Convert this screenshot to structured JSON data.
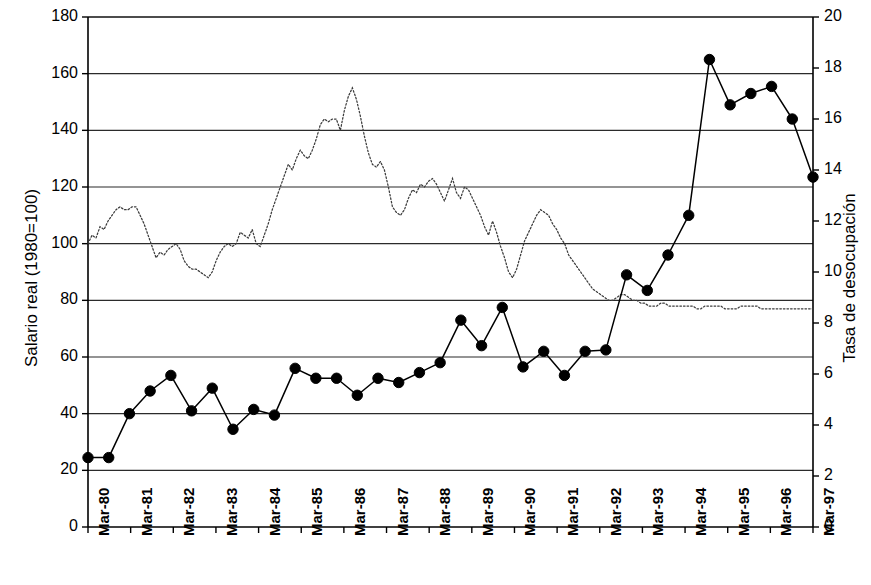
{
  "chart": {
    "title": "",
    "left_axis_title": "Salario real (1980=100)",
    "right_axis_title": "Tasa de desocupación",
    "left_ticks": [
      "0",
      "20",
      "40",
      "60",
      "80",
      "100",
      "120",
      "140",
      "160",
      "180"
    ],
    "right_ticks": [
      "0",
      "2",
      "4",
      "6",
      "8",
      "10",
      "12",
      "14",
      "16",
      "18",
      "20"
    ],
    "x_ticks": [
      "Mar-80",
      "Mar-81",
      "Mar-82",
      "Mar-83",
      "Mar-84",
      "Mar-85",
      "Mar-86",
      "Mar-87",
      "Mar-88",
      "Mar-89",
      "Mar-90",
      "Mar-91",
      "Mar-92",
      "Mar-93",
      "Mar-94",
      "Mar-95",
      "Mar-96",
      "Mar-97"
    ],
    "colors": {
      "axis": "#000000",
      "series_marker": "#000000",
      "series_dotted": "#555555",
      "grid": "#333333"
    }
  },
  "chart_data": {
    "type": "line",
    "title": "",
    "xlabel": "",
    "ylabel": "Salario real (1980=100)",
    "y2label": "Tasa de desocupación",
    "ylim": [
      0,
      180
    ],
    "y2lim": [
      0,
      20
    ],
    "ytick_step": 20,
    "y2tick_step": 2,
    "grid": true,
    "legend": "none",
    "categories": [
      "Mar-80",
      "Mar-81",
      "Mar-82",
      "Mar-83",
      "Mar-84",
      "Mar-85",
      "Mar-86",
      "Mar-87",
      "Mar-88",
      "Mar-89",
      "Mar-90",
      "Mar-91",
      "Mar-92",
      "Mar-93",
      "Mar-94",
      "Mar-95",
      "Mar-96",
      "Mar-97"
    ],
    "series": [
      {
        "name": "Tasa de desocupación",
        "axis": "right",
        "style": "solid-line-with-filled-circle-markers",
        "frequency": "semiannual",
        "x_labels": [
          "Mar-80",
          "Oct-80",
          "Mar-81",
          "Oct-81",
          "Mar-82",
          "Oct-82",
          "Mar-83",
          "Oct-83",
          "Mar-84",
          "Oct-84",
          "Mar-85",
          "Oct-85",
          "Mar-86",
          "Oct-86",
          "Mar-87",
          "Oct-87",
          "Mar-88",
          "Oct-88",
          "Mar-89",
          "Oct-89",
          "Mar-90",
          "Oct-90",
          "Mar-91",
          "Oct-91",
          "Mar-92",
          "Oct-92",
          "Mar-93",
          "Oct-93",
          "Mar-94",
          "Oct-94",
          "Mar-95",
          "Oct-95",
          "Mar-96",
          "Oct-96",
          "Mar-97",
          "Oct-97"
        ],
        "values_right_axis": [
          2.7,
          2.7,
          4.4,
          5.3,
          5.9,
          4.5,
          5.4,
          3.8,
          4.6,
          4.3,
          6.2,
          5.8,
          5.8,
          5.1,
          5.8,
          5.6,
          6.0,
          6.4,
          8.1,
          7.1,
          8.6,
          6.2,
          6.8,
          5.9,
          6.8,
          6.9,
          9.9,
          9.3,
          10.6,
          12.2,
          18.4,
          16.6,
          17.0,
          17.2,
          16.0,
          13.7
        ],
        "values_left_scale": [
          24.5,
          24.5,
          40.0,
          48.0,
          53.5,
          41.0,
          49.0,
          34.5,
          41.5,
          39.5,
          56.0,
          52.5,
          52.5,
          46.5,
          52.5,
          51.0,
          54.5,
          58.0,
          73.0,
          64.0,
          77.5,
          56.5,
          62.0,
          53.5,
          62.0,
          62.5,
          89.0,
          83.5,
          96.0,
          110.0,
          165.0,
          149.0,
          153.0,
          155.5,
          144.0,
          123.5
        ]
      },
      {
        "name": "Salario real (1980=100)",
        "axis": "left",
        "style": "dotted-line",
        "frequency": "monthly",
        "values_left_axis": [
          100,
          103,
          102,
          106,
          105,
          108,
          110,
          112,
          113,
          112,
          112,
          113,
          113,
          110,
          107,
          103,
          99,
          95,
          97,
          96,
          98,
          99,
          100,
          98,
          94,
          92,
          91,
          91,
          90,
          89,
          88,
          90,
          94,
          97,
          99,
          100,
          99,
          100,
          104,
          103,
          102,
          105,
          100,
          99,
          103,
          107,
          112,
          116,
          120,
          124,
          128,
          126,
          130,
          133,
          131,
          130,
          133,
          137,
          142,
          144,
          143,
          144,
          144,
          140,
          147,
          152,
          155,
          151,
          145,
          138,
          132,
          128,
          127,
          129,
          126,
          120,
          113,
          111,
          110,
          112,
          116,
          119,
          118,
          121,
          120,
          122,
          123,
          121,
          118,
          115,
          119,
          123,
          118,
          116,
          120,
          119,
          116,
          113,
          110,
          106,
          103,
          108,
          104,
          99,
          95,
          90,
          88,
          91,
          96,
          101,
          104,
          107,
          110,
          112,
          111,
          110,
          107,
          105,
          102,
          100,
          96,
          94,
          92,
          90,
          88,
          86,
          84,
          83,
          82,
          81,
          80,
          80,
          81,
          82,
          82,
          81,
          80,
          80,
          79,
          79,
          78,
          78,
          78,
          79,
          79,
          78,
          78,
          78,
          78,
          78,
          78,
          78,
          77,
          77,
          78,
          78,
          78,
          78,
          78,
          77,
          77,
          77,
          77,
          78,
          78,
          78,
          78,
          78,
          77,
          77,
          77,
          77,
          77,
          77,
          77,
          77,
          77,
          77,
          77,
          77,
          77,
          77
        ]
      }
    ]
  }
}
